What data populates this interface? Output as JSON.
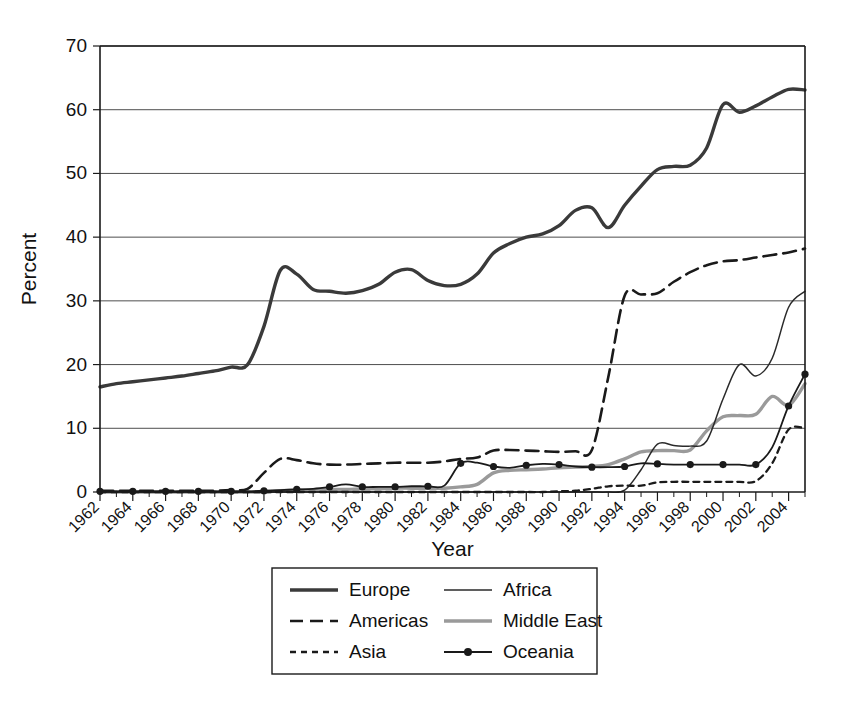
{
  "chart_data": {
    "type": "line",
    "title": "",
    "xlabel": "Year",
    "ylabel": "Percent",
    "xlim": [
      1962,
      2005
    ],
    "ylim": [
      0,
      70
    ],
    "ytick_values": [
      0,
      10,
      20,
      30,
      40,
      50,
      60,
      70
    ],
    "ytick_labels": [
      "0",
      "10",
      "20",
      "30",
      "40",
      "50",
      "60",
      "70"
    ],
    "xtick_labels": [
      "1962",
      "1964",
      "1966",
      "1968",
      "1970",
      "1972",
      "1974",
      "1976",
      "1978",
      "1980",
      "1982",
      "1984",
      "1986",
      "1988",
      "1990",
      "1992",
      "1994",
      "1996",
      "1998",
      "2000",
      "2002",
      "2004"
    ],
    "xtick_values": [
      1962,
      1964,
      1966,
      1968,
      1970,
      1972,
      1974,
      1976,
      1978,
      1980,
      1982,
      1984,
      1986,
      1988,
      1990,
      1992,
      1994,
      1996,
      1998,
      2000,
      2002,
      2004
    ],
    "grid": "horizontal",
    "legend_position": "below",
    "x": [
      1962,
      1963,
      1964,
      1965,
      1966,
      1967,
      1968,
      1969,
      1970,
      1971,
      1972,
      1973,
      1974,
      1975,
      1976,
      1977,
      1978,
      1979,
      1980,
      1981,
      1982,
      1983,
      1984,
      1985,
      1986,
      1987,
      1988,
      1989,
      1990,
      1991,
      1992,
      1993,
      1994,
      1995,
      1996,
      1997,
      1998,
      1999,
      2000,
      2001,
      2002,
      2003,
      2004,
      2005
    ],
    "series": [
      {
        "name": "Europe",
        "style": "solid-thick",
        "color": "#3a3a3a",
        "values": [
          16.5,
          17.0,
          17.3,
          17.6,
          17.9,
          18.2,
          18.6,
          19.0,
          19.6,
          20.0,
          26.0,
          34.8,
          34.2,
          31.8,
          31.5,
          31.2,
          31.6,
          32.6,
          34.5,
          34.9,
          33.2,
          32.4,
          32.6,
          34.2,
          37.5,
          39.0,
          40.0,
          40.5,
          41.8,
          44.2,
          44.6,
          41.5,
          45.0,
          48.0,
          50.6,
          51.1,
          51.3,
          54.0,
          60.8,
          59.6,
          60.6,
          62.0,
          63.2,
          63.1
        ]
      },
      {
        "name": "Americas",
        "style": "dashed-long",
        "color": "#1a1a1a",
        "values": [
          0.2,
          0.2,
          0.2,
          0.2,
          0.2,
          0.2,
          0.2,
          0.2,
          0.3,
          0.5,
          3.0,
          5.2,
          5.0,
          4.5,
          4.3,
          4.3,
          4.4,
          4.5,
          4.6,
          4.6,
          4.6,
          4.8,
          5.2,
          5.4,
          6.5,
          6.6,
          6.5,
          6.4,
          6.3,
          6.4,
          6.6,
          18.0,
          30.8,
          31.0,
          31.2,
          33.0,
          34.5,
          35.6,
          36.2,
          36.4,
          36.8,
          37.2,
          37.6,
          38.2
        ]
      },
      {
        "name": "Asia",
        "style": "dashed-short",
        "color": "#1a1a1a",
        "values": [
          0.0,
          0.0,
          0.0,
          0.0,
          0.0,
          0.0,
          0.0,
          0.0,
          0.0,
          0.0,
          0.0,
          0.0,
          0.0,
          0.0,
          0.0,
          0.0,
          0.0,
          0.0,
          0.0,
          0.0,
          0.0,
          0.0,
          0.0,
          0.0,
          0.0,
          0.0,
          0.0,
          0.0,
          0.1,
          0.2,
          0.5,
          0.9,
          1.0,
          1.0,
          1.5,
          1.6,
          1.6,
          1.6,
          1.6,
          1.6,
          1.7,
          4.5,
          9.8,
          10.0
        ]
      },
      {
        "name": "Africa",
        "style": "solid-thin",
        "color": "#2a2a2a",
        "values": [
          0.0,
          0.0,
          0.0,
          0.0,
          0.0,
          0.0,
          0.0,
          0.0,
          0.0,
          0.0,
          0.0,
          0.0,
          0.0,
          0.0,
          0.0,
          0.0,
          0.0,
          0.0,
          0.0,
          0.0,
          0.0,
          0.0,
          0.0,
          0.0,
          0.0,
          0.0,
          0.0,
          0.0,
          0.0,
          0.0,
          0.0,
          0.0,
          0.3,
          3.5,
          7.5,
          7.3,
          7.2,
          8.0,
          14.6,
          20.0,
          18.2,
          21.0,
          29.0,
          31.5
        ]
      },
      {
        "name": "Middle East",
        "style": "solid-gray",
        "color": "#9a9a9a",
        "values": [
          0.0,
          0.0,
          0.0,
          0.0,
          0.0,
          0.0,
          0.0,
          0.0,
          0.0,
          0.0,
          0.0,
          0.2,
          0.3,
          0.3,
          0.4,
          0.4,
          0.5,
          0.5,
          0.6,
          0.6,
          0.6,
          0.6,
          0.8,
          1.2,
          3.0,
          3.4,
          3.5,
          3.6,
          3.8,
          3.9,
          4.0,
          4.3,
          5.2,
          6.3,
          6.5,
          6.5,
          6.6,
          9.6,
          11.8,
          12.0,
          12.2,
          15.0,
          13.6,
          17.0
        ]
      },
      {
        "name": "Oceania",
        "style": "solid-marker",
        "color": "#1a1a1a",
        "marker": "circle",
        "marker_years": [
          1962,
          1964,
          1966,
          1968,
          1970,
          1972,
          1974,
          1976,
          1978,
          1980,
          1982,
          1984,
          1986,
          1988,
          1990,
          1992,
          1994,
          1996,
          1998,
          2000,
          2002,
          2004,
          2005
        ],
        "values": [
          0.1,
          0.1,
          0.1,
          0.1,
          0.1,
          0.1,
          0.1,
          0.1,
          0.1,
          0.1,
          0.2,
          0.3,
          0.4,
          0.5,
          0.8,
          1.2,
          0.8,
          0.8,
          0.8,
          0.9,
          0.9,
          1.0,
          4.5,
          4.6,
          4.0,
          3.8,
          4.2,
          4.4,
          4.3,
          4.0,
          3.9,
          3.9,
          4.0,
          4.5,
          4.4,
          4.3,
          4.3,
          4.3,
          4.3,
          4.3,
          4.3,
          7.0,
          13.5,
          18.5
        ]
      }
    ]
  },
  "legend": {
    "entries": [
      {
        "label": "Europe",
        "column": 0,
        "row": 0
      },
      {
        "label": "Americas",
        "column": 0,
        "row": 1
      },
      {
        "label": "Asia",
        "column": 0,
        "row": 2
      },
      {
        "label": "Africa",
        "column": 1,
        "row": 0
      },
      {
        "label": "Middle East",
        "column": 1,
        "row": 1
      },
      {
        "label": "Oceania",
        "column": 1,
        "row": 2
      }
    ]
  },
  "colors": {
    "europe": "#3a3a3a",
    "americas": "#1a1a1a",
    "asia": "#1a1a1a",
    "africa": "#2a2a2a",
    "middle_east": "#9a9a9a",
    "oceania": "#1a1a1a",
    "axis": "#1a1a1a",
    "grid": "#3a3a3a",
    "background": "#ffffff"
  }
}
